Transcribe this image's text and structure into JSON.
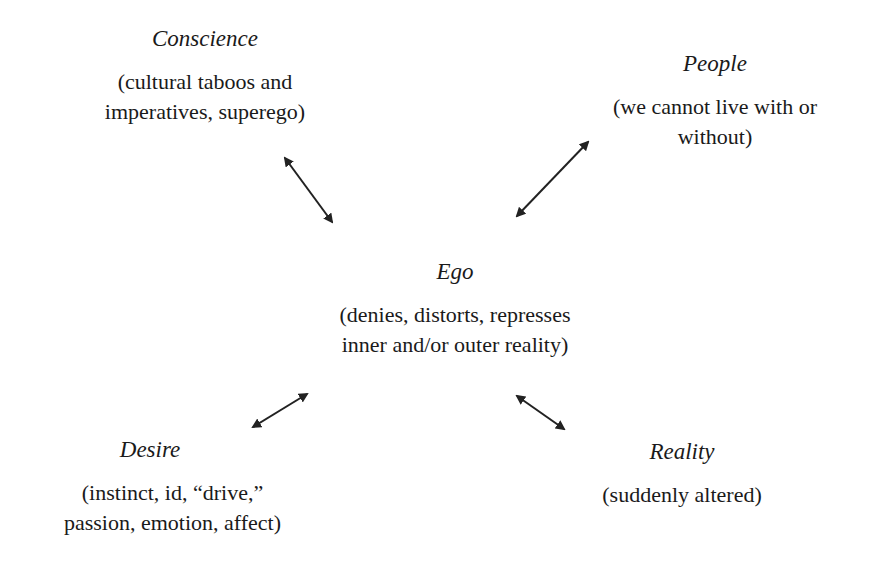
{
  "nodes": {
    "conscience": {
      "title": "Conscience",
      "lines": [
        "(cultural taboos and",
        "imperatives, superego)"
      ]
    },
    "people": {
      "title": "People",
      "lines": [
        "(we cannot live with or",
        "without)"
      ]
    },
    "ego": {
      "title": "Ego",
      "lines": [
        "(denies, distorts, represses",
        "inner and/or outer reality)"
      ]
    },
    "desire": {
      "title": "Desire",
      "lines": [
        "(instinct, id, “drive,”",
        "passion, emotion, affect)"
      ]
    },
    "reality": {
      "title": "Reality",
      "lines": [
        "(suddenly altered)"
      ]
    }
  },
  "arrows": [
    {
      "from": "conscience",
      "to": "ego",
      "type": "bidirectional"
    },
    {
      "from": "people",
      "to": "ego",
      "type": "bidirectional"
    },
    {
      "from": "desire",
      "to": "ego",
      "type": "bidirectional"
    },
    {
      "from": "reality",
      "to": "ego",
      "type": "bidirectional"
    }
  ],
  "colors": {
    "text": "#1a1a1a",
    "arrow": "#222222",
    "background": "#ffffff"
  }
}
